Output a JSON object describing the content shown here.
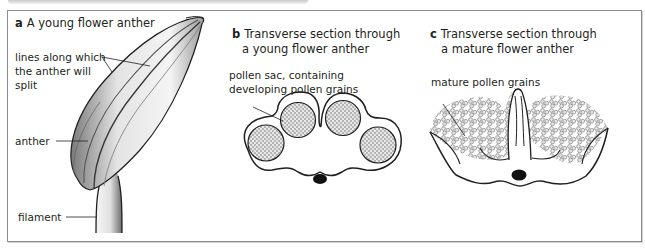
{
  "figure": {
    "panels": [
      {
        "letter": "a",
        "title": "A young flower anther",
        "labels": {
          "split_lines_1": "lines along which",
          "split_lines_2": "the anther will",
          "split_lines_3": "split",
          "anther": "anther",
          "filament": "filament"
        }
      },
      {
        "letter": "b",
        "title_line1": "Transverse section through",
        "title_line2": "a young flower anther",
        "labels": {
          "pollen_sac_1": "pollen sac, containing",
          "pollen_sac_2": "developing pollen grains"
        }
      },
      {
        "letter": "c",
        "title_line1": "Transverse section through",
        "title_line2": "a mature flower anther",
        "labels": {
          "mature_pollen": "mature pollen grains"
        }
      }
    ],
    "colors": {
      "ink": "#231f20",
      "frame_border": "#8c8c8c",
      "shading": "#d9d9d9",
      "pollen_fill": "#8a8a8a"
    }
  }
}
